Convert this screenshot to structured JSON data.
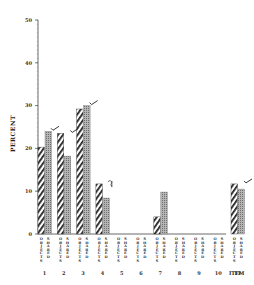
{
  "chart_data": {
    "type": "bar",
    "title": "",
    "xlabel": "ITEM",
    "ylabel": "PERCENT",
    "ylim": [
      0,
      50
    ],
    "yticks": [
      0,
      10,
      20,
      30,
      40,
      50
    ],
    "grid": false,
    "legend_position": "none",
    "categories": [
      "1",
      "2",
      "3",
      "4",
      "5",
      "6",
      "7",
      "8",
      "9",
      "10",
      "11"
    ],
    "series": [
      {
        "name": "OBJECTS",
        "pattern": "diagonal-hatch",
        "values": [
          20.3,
          23.5,
          29.2,
          11.7,
          0,
          0,
          4.0,
          0,
          0,
          0,
          11.7
        ]
      },
      {
        "name": "SHARED",
        "pattern": "dotted-gray",
        "values": [
          24.0,
          18.2,
          30.0,
          8.4,
          0,
          0,
          9.8,
          0,
          0,
          0,
          10.5
        ]
      }
    ],
    "annotations": [
      {
        "item": "1",
        "type": "check-mark"
      },
      {
        "item": "2",
        "type": "check-mark"
      },
      {
        "item": "3",
        "type": "check-mark"
      },
      {
        "item": "4",
        "type": "handwritten-mark"
      },
      {
        "item": "11",
        "type": "check-mark"
      }
    ]
  },
  "labels": {
    "y_axis": "PERCENT",
    "x_axis": "ITEM",
    "pair_label_a": "OBJECTS",
    "pair_label_b": "SHARED"
  },
  "colors": {
    "hatch": "#222222",
    "dotted": "#8a8a8a",
    "axis": "#444444"
  }
}
